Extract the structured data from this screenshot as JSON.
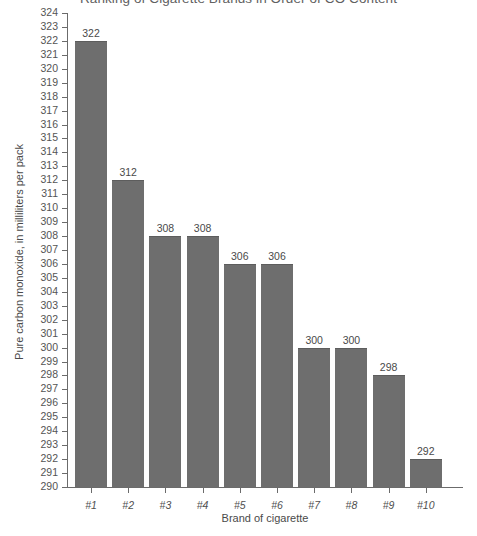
{
  "chart_data": {
    "type": "bar",
    "title": "Ranking of Cigarette Brands in Order of CO Content",
    "xlabel": "Brand of cigarette",
    "ylabel": "Pure carbon monoxide, in milliliters per pack",
    "categories": [
      "#1",
      "#2",
      "#3",
      "#4",
      "#5",
      "#6",
      "#7",
      "#8",
      "#9",
      "#10"
    ],
    "values": [
      322,
      312,
      308,
      308,
      306,
      306,
      300,
      300,
      298,
      292
    ],
    "value_labels": [
      "322",
      "312",
      "308",
      "308",
      "306",
      "306",
      "300",
      "300",
      "298",
      "292"
    ],
    "ylim": [
      290,
      324
    ],
    "ytick_step": 1,
    "yticks": [
      290,
      291,
      292,
      293,
      294,
      295,
      296,
      297,
      298,
      299,
      300,
      301,
      302,
      303,
      304,
      305,
      306,
      307,
      308,
      309,
      310,
      311,
      312,
      313,
      314,
      315,
      316,
      317,
      318,
      319,
      320,
      321,
      322,
      323,
      324
    ],
    "ytick_labels": [
      "290",
      "291",
      "292",
      "293",
      "294",
      "295",
      "296",
      "297",
      "298",
      "299",
      "300",
      "301",
      "302",
      "303",
      "304",
      "305",
      "306",
      "307",
      "308",
      "309",
      "310",
      "311",
      "312",
      "313",
      "314",
      "315",
      "316",
      "317",
      "318",
      "319",
      "320",
      "321",
      "322",
      "323",
      "324"
    ],
    "grid": false,
    "legend": false,
    "bar_color": "#6e6e6e",
    "axis_color": "#6b6b6b",
    "background_color": "#ffffff",
    "text_color": "#4a4a4a"
  }
}
